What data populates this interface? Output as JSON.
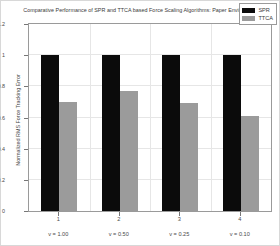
{
  "chart_data": {
    "type": "bar",
    "title": "Comparative Performance of SPR and TTCA based Force Scaling Algorithms: Paper Environment",
    "xlabel": "",
    "ylabel": "Normalized RMS Force Tracking Error",
    "categories": [
      "1",
      "2",
      "3",
      "4"
    ],
    "group_labels": [
      "v = 1.00",
      "v = 0.50",
      "v = 0.25",
      "v = 0.10"
    ],
    "series": [
      {
        "name": "SPR",
        "color": "#0b0b0b",
        "values": [
          1.0,
          1.0,
          1.0,
          1.0
        ]
      },
      {
        "name": "TTCA",
        "color": "#9b9b9b",
        "values": [
          0.7,
          0.77,
          0.69,
          0.61
        ]
      }
    ],
    "ylim": [
      0,
      1.2
    ],
    "yticks": [
      "0",
      "0.2",
      "0.4",
      "0.6",
      "0.8",
      "1",
      "1.2"
    ],
    "ytick_values": [
      0,
      0.2,
      0.4,
      0.6,
      0.8,
      1,
      1.2
    ],
    "grid": true,
    "legend_position": "top-right"
  },
  "figure": {
    "background_color": "#ffffff",
    "axis_color": "#9a9a9a",
    "grid_color": "#e6e6e6",
    "text_color": "#4a4a4a"
  }
}
